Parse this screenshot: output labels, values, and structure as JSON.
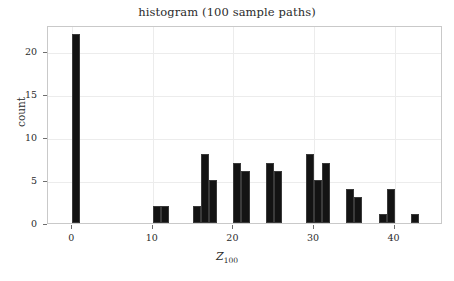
{
  "chart_data": {
    "type": "bar",
    "title": "histogram (100 sample paths)",
    "xlabel": "Z",
    "xlabel_sub": "100",
    "ylabel": "count",
    "xlim": [
      -3,
      46
    ],
    "ylim": [
      0,
      23
    ],
    "bin_width": 1,
    "grid": true,
    "legend": null,
    "bar_color": "#131313",
    "categories": [
      0,
      10,
      11,
      15,
      16,
      17,
      20,
      21,
      24,
      25,
      29,
      30,
      31,
      34,
      35,
      38,
      39,
      42
    ],
    "values": [
      22,
      2,
      2,
      2,
      8,
      5,
      7,
      6,
      7,
      6,
      8,
      5,
      7,
      4,
      3,
      1,
      4,
      1
    ],
    "bars": [
      {
        "x": 0,
        "count": 22
      },
      {
        "x": 10,
        "count": 2
      },
      {
        "x": 11,
        "count": 2
      },
      {
        "x": 15,
        "count": 2
      },
      {
        "x": 16,
        "count": 8
      },
      {
        "x": 17,
        "count": 5
      },
      {
        "x": 20,
        "count": 7
      },
      {
        "x": 21,
        "count": 6
      },
      {
        "x": 24,
        "count": 7
      },
      {
        "x": 25,
        "count": 6
      },
      {
        "x": 29,
        "count": 8
      },
      {
        "x": 30,
        "count": 5
      },
      {
        "x": 31,
        "count": 7
      },
      {
        "x": 34,
        "count": 4
      },
      {
        "x": 35,
        "count": 3
      },
      {
        "x": 38,
        "count": 1
      },
      {
        "x": 39,
        "count": 4
      },
      {
        "x": 42,
        "count": 1
      }
    ],
    "xticks": [
      0,
      10,
      20,
      30,
      40
    ],
    "xtick_labels": [
      "0",
      "10",
      "20",
      "30",
      "40"
    ],
    "yticks": [
      0,
      5,
      10,
      15,
      20
    ],
    "ytick_labels": [
      "0",
      "5",
      "10",
      "15",
      "20"
    ]
  }
}
